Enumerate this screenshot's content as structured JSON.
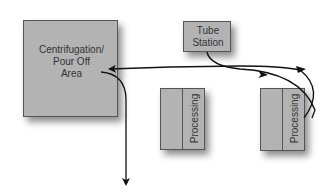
{
  "diagram": {
    "nodes": {
      "centrifugation": {
        "label_lines": [
          "Centrifugation/",
          "Pour Off",
          "Area"
        ]
      },
      "tube_station": {
        "label_lines": [
          "Tube",
          "Station"
        ]
      },
      "processing_middle": {
        "label": "Processing"
      },
      "processing_right": {
        "label": "Processing"
      }
    },
    "colors": {
      "box_fill": "#b3b3b3",
      "border": "#555555",
      "arrow": "#111111",
      "text": "#333333"
    }
  }
}
